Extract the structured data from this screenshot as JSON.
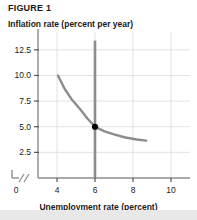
{
  "figure": {
    "label": "FIGURE 1"
  },
  "chart_data": {
    "type": "line",
    "title": "FIGURE 1",
    "xlabel": "Unemployment rate (percent)",
    "ylabel": "Inflation rate (percent per year)",
    "xlim": [
      3.0,
      11.0
    ],
    "ylim": [
      0,
      13.75
    ],
    "x_ticks": [
      0,
      4,
      6,
      8,
      10
    ],
    "x_tick_labels": [
      "0",
      "4",
      "6",
      "8",
      "10"
    ],
    "y_ticks": [
      2.5,
      5.0,
      7.5,
      10.0,
      12.5
    ],
    "y_tick_labels": [
      "2.5",
      "5.0",
      "7.5",
      "10.0",
      "12.5"
    ],
    "grid": true,
    "axis_break": "//",
    "series": [
      {
        "name": "short-run-phillips-curve",
        "type": "curve",
        "color": "#8c8c8c",
        "points": [
          {
            "x": 4.05,
            "y": 10.0
          },
          {
            "x": 4.4,
            "y": 8.7
          },
          {
            "x": 4.8,
            "y": 7.6
          },
          {
            "x": 5.2,
            "y": 6.75
          },
          {
            "x": 5.6,
            "y": 5.8
          },
          {
            "x": 6.0,
            "y": 5.0
          },
          {
            "x": 6.5,
            "y": 4.55
          },
          {
            "x": 7.0,
            "y": 4.25
          },
          {
            "x": 7.6,
            "y": 3.95
          },
          {
            "x": 8.2,
            "y": 3.75
          },
          {
            "x": 8.7,
            "y": 3.65
          }
        ]
      },
      {
        "name": "long-run-vertical-line",
        "type": "vertical",
        "color": "#8c8c8c",
        "x": 6.0,
        "y_from": 0,
        "y_to": 13.4
      }
    ],
    "markers": [
      {
        "name": "equilibrium-point",
        "x": 6.0,
        "y": 5.0,
        "color": "#000000"
      }
    ]
  }
}
